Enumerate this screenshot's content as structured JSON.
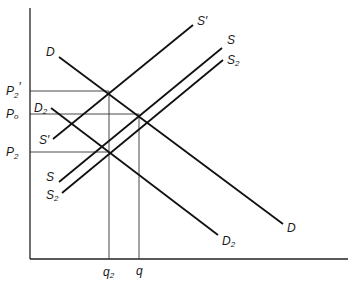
{
  "diagram": {
    "type": "supply-demand",
    "axes": {
      "y_axis": {
        "x": 30,
        "top": 8,
        "bottom": 259
      },
      "x_axis": {
        "y": 259,
        "left": 30,
        "right": 348
      }
    },
    "price_levels": [
      {
        "id": "p2_prime",
        "label": "P",
        "sub": "2",
        "prime": "′",
        "y": 91
      },
      {
        "id": "p0",
        "label": "P",
        "sub": "o",
        "prime": "",
        "y": 114
      },
      {
        "id": "p2",
        "label": "P",
        "sub": "2",
        "prime": "",
        "y": 152
      }
    ],
    "quantity_levels": [
      {
        "id": "q2",
        "label": "q",
        "sub": "2",
        "x": 109
      },
      {
        "id": "q",
        "label": "q",
        "sub": "",
        "x": 139
      }
    ],
    "curves": [
      {
        "id": "D",
        "label": "D",
        "sub": "",
        "x1": 59,
        "y1": 57,
        "x2": 283,
        "y2": 224
      },
      {
        "id": "D2",
        "label": "D",
        "sub": "2",
        "x1": 51,
        "y1": 108,
        "x2": 218,
        "y2": 235
      },
      {
        "id": "S_prime",
        "label": "S′",
        "sub": "",
        "x1": 53,
        "y1": 139,
        "x2": 193,
        "y2": 25
      },
      {
        "id": "S",
        "label": "S",
        "sub": "",
        "x1": 59,
        "y1": 182,
        "x2": 222,
        "y2": 48
      },
      {
        "id": "S2",
        "label": "S",
        "sub": "2",
        "x1": 62,
        "y1": 193,
        "x2": 223,
        "y2": 60
      }
    ],
    "labels": {
      "D_start": "D",
      "D_end": "D",
      "D2_start": "D",
      "D2_end": "D",
      "S_prime_start": "S′",
      "S_prime_end": "S′",
      "S_start": "S",
      "S_end": "S",
      "S2_start": "S",
      "S2_end": "S",
      "sub2": "2",
      "P": "P",
      "sub_o": "o",
      "prime": "′",
      "q": "q"
    }
  }
}
